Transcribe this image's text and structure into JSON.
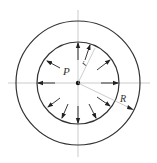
{
  "diagram": {
    "labels": {
      "pressure": "P",
      "inner_radius": "r",
      "outer_radius": "R"
    },
    "colors": {
      "stroke": "#333333",
      "axis": "#aaaaaa",
      "background": "#ffffff"
    }
  }
}
